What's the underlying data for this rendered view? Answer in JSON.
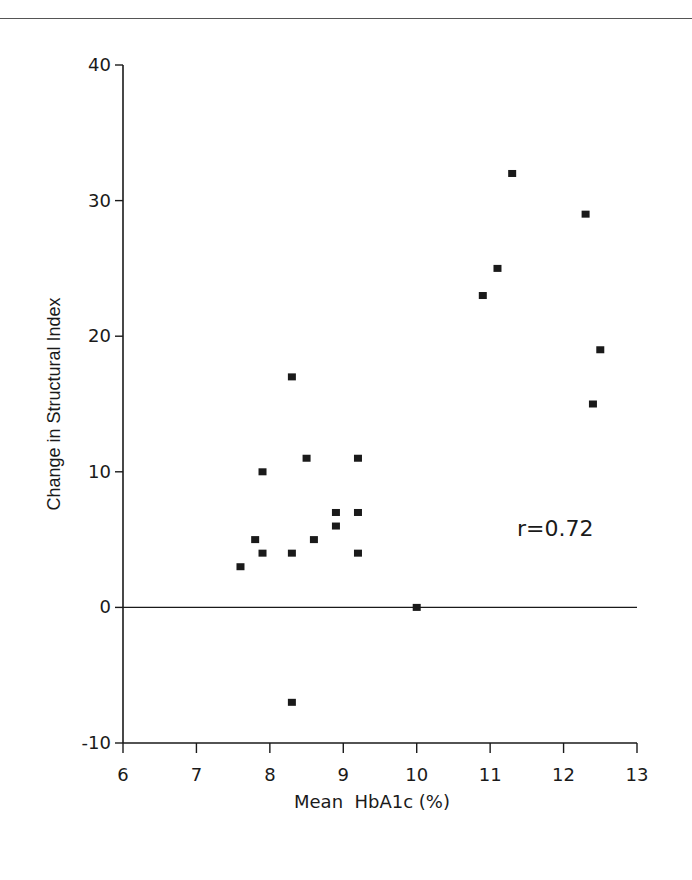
{
  "chart_data": {
    "type": "scatter",
    "title": "",
    "xlabel": "Mean  HbA1c (%)",
    "ylabel": "Change in Structural Index",
    "xlim": [
      6,
      13
    ],
    "ylim": [
      -10,
      40
    ],
    "xticks": [
      6,
      7,
      8,
      9,
      10,
      11,
      12,
      13
    ],
    "yticks": [
      -10,
      0,
      10,
      20,
      30,
      40
    ],
    "grid": false,
    "legend": null,
    "reference_line": {
      "y": 0,
      "x_from": 6,
      "x_to": 13
    },
    "annotations": [
      {
        "text": "r=0.72",
        "x": 11.8,
        "y": 6
      }
    ],
    "series": [
      {
        "name": "patients",
        "marker": "square",
        "points": [
          {
            "x": 7.6,
            "y": 3
          },
          {
            "x": 7.8,
            "y": 5
          },
          {
            "x": 7.9,
            "y": 4
          },
          {
            "x": 7.9,
            "y": 10
          },
          {
            "x": 8.3,
            "y": 4
          },
          {
            "x": 8.3,
            "y": 17
          },
          {
            "x": 8.3,
            "y": -7
          },
          {
            "x": 8.5,
            "y": 11
          },
          {
            "x": 8.6,
            "y": 5
          },
          {
            "x": 8.9,
            "y": 7
          },
          {
            "x": 8.9,
            "y": 6
          },
          {
            "x": 9.2,
            "y": 11
          },
          {
            "x": 9.2,
            "y": 7
          },
          {
            "x": 9.2,
            "y": 4
          },
          {
            "x": 10.0,
            "y": 0
          },
          {
            "x": 10.9,
            "y": 23
          },
          {
            "x": 11.1,
            "y": 25
          },
          {
            "x": 11.3,
            "y": 32
          },
          {
            "x": 12.3,
            "y": 29
          },
          {
            "x": 12.4,
            "y": 15
          },
          {
            "x": 12.5,
            "y": 19
          }
        ]
      }
    ]
  },
  "labels": {
    "xlabel": "Mean  HbA1c (%)",
    "ylabel": "Change in Structural Index",
    "annotation": "r=0.72"
  },
  "colors": {
    "ink": "#1a1a1a",
    "background": "#ffffff"
  }
}
